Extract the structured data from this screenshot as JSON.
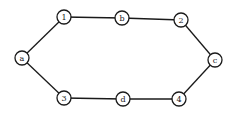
{
  "diagram": {
    "type": "undirected-graph",
    "shape": "hexagonal cycle",
    "node_radius": 7,
    "stroke_color": "#1a1a1a",
    "fill_color": "#ffffff",
    "nodes": [
      {
        "id": "a",
        "label": "a",
        "x": 22,
        "y": 58
      },
      {
        "id": "1",
        "label": "1",
        "x": 64,
        "y": 17
      },
      {
        "id": "b",
        "label": "b",
        "x": 122,
        "y": 18
      },
      {
        "id": "2",
        "label": "2",
        "x": 181,
        "y": 20
      },
      {
        "id": "c",
        "label": "c",
        "x": 215,
        "y": 60
      },
      {
        "id": "4",
        "label": "4",
        "x": 179,
        "y": 99
      },
      {
        "id": "d",
        "label": "d",
        "x": 123,
        "y": 99
      },
      {
        "id": "3",
        "label": "3",
        "x": 64,
        "y": 98
      }
    ],
    "edges": [
      {
        "from": "a",
        "to": "1"
      },
      {
        "from": "1",
        "to": "b"
      },
      {
        "from": "b",
        "to": "2"
      },
      {
        "from": "2",
        "to": "c"
      },
      {
        "from": "c",
        "to": "4"
      },
      {
        "from": "4",
        "to": "d"
      },
      {
        "from": "d",
        "to": "3"
      },
      {
        "from": "3",
        "to": "a"
      }
    ]
  }
}
